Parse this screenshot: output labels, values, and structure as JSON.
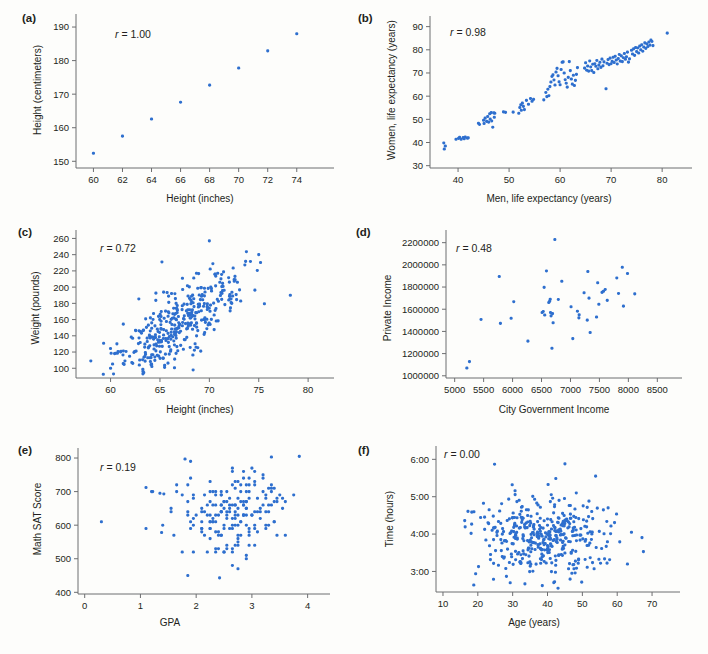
{
  "figure": {
    "type": "scatterplot-matrix-figure",
    "background": "#fdfdfb",
    "dot_color": "#2e6fce",
    "axis_color": "#6d6e70",
    "text_color": "#231f20"
  },
  "panels": [
    {
      "tag": "(a)",
      "r_label": "r = 1.00",
      "r_value": 1.0,
      "xlabel": "Height (inches)",
      "ylabel": "Height (centimeters)",
      "xticks": [
        60,
        62,
        64,
        66,
        68,
        70,
        72,
        74
      ],
      "yticks": [
        150,
        160,
        170,
        180,
        190
      ],
      "xlim": [
        58.8,
        75.6
      ],
      "ylim": [
        148,
        191.5
      ]
    },
    {
      "tag": "(b)",
      "r_label": "r = 0.98",
      "r_value": 0.98,
      "xlabel": "Men, life expectancy (years)",
      "ylabel": "Women, life expectancy (years)",
      "xticks": [
        40,
        50,
        60,
        70,
        80
      ],
      "yticks": [
        30,
        40,
        50,
        60,
        70,
        80,
        90
      ],
      "xlim": [
        34.5,
        83.5
      ],
      "ylim": [
        29,
        92
      ]
    },
    {
      "tag": "(c)",
      "r_label": "r = 0.72",
      "r_value": 0.72,
      "xlabel": "Height (inches)",
      "ylabel": "Weight (pounds)",
      "xticks": [
        60,
        65,
        70,
        75,
        80
      ],
      "yticks": [
        100,
        120,
        140,
        160,
        180,
        200,
        220,
        240,
        260
      ],
      "xlim": [
        56.5,
        81
      ],
      "ylim": [
        88,
        263
      ]
    },
    {
      "tag": "(d)",
      "r_label": "r = 0.48",
      "r_value": 0.48,
      "xlabel": "City Government Income",
      "ylabel": "Private Income",
      "xticks": [
        5000,
        5500,
        6000,
        6500,
        7000,
        7500,
        8000,
        8500
      ],
      "yticks": [
        1000000,
        1200000,
        1400000,
        1600000,
        1800000,
        2000000,
        2200000
      ],
      "xlim": [
        4850,
        8650
      ],
      "ylim": [
        980000,
        2260000
      ]
    },
    {
      "tag": "(e)",
      "r_label": "r = 0.19",
      "r_value": 0.19,
      "xlabel": "GPA",
      "ylabel": "Math SAT Score",
      "xticks": [
        0,
        1,
        2,
        3,
        4
      ],
      "yticks": [
        400,
        500,
        600,
        700,
        800
      ],
      "xlim": [
        -0.12,
        4.15
      ],
      "ylim": [
        395,
        812
      ]
    },
    {
      "tag": "(f)",
      "r_label": "r = 0.00",
      "r_value": 0.0,
      "xlabel": "Age (years)",
      "ylabel": "Time (hours)",
      "xticks": [
        "10",
        "20",
        "30",
        "40",
        "50",
        "60",
        "70"
      ],
      "xtickvals": [
        10,
        20,
        30,
        40,
        50,
        60,
        70
      ],
      "yticks": [
        "3:00",
        "4:00",
        "5:00",
        "6:00"
      ],
      "ytickvals": [
        3,
        4,
        5,
        6
      ],
      "xlim": [
        8,
        74
      ],
      "ylim": [
        2.45,
        6.25
      ]
    }
  ],
  "chart_data": [
    {
      "type": "scatter",
      "panel": "a",
      "title": "Height (centimeters) vs Height (inches)",
      "xlabel": "Height (inches)",
      "ylabel": "Height (centimeters)",
      "correlation": 1.0,
      "xlim": [
        58.8,
        75.6
      ],
      "ylim": [
        148,
        191.5
      ],
      "grid": false,
      "legend": "none",
      "points": [
        [
          60,
          152.4
        ],
        [
          62,
          157.5
        ],
        [
          64,
          162.6
        ],
        [
          66,
          167.6
        ],
        [
          68,
          172.7
        ],
        [
          70,
          177.8
        ],
        [
          72,
          182.9
        ],
        [
          74,
          188.0
        ]
      ]
    },
    {
      "type": "scatter",
      "panel": "b",
      "title": "Women vs Men life expectancy",
      "xlabel": "Men, life expectancy (years)",
      "ylabel": "Women, life expectancy (years)",
      "correlation": 0.98,
      "xlim": [
        34.5,
        83.5
      ],
      "ylim": [
        29,
        92
      ],
      "grid": false,
      "legend": "none",
      "points": [
        [
          37.2,
          39.8
        ],
        [
          37.3,
          37.2
        ],
        [
          37.5,
          38.5
        ],
        [
          39.6,
          41.4
        ],
        [
          40.1,
          41.8
        ],
        [
          40.3,
          42.2
        ],
        [
          40.6,
          41.4
        ],
        [
          41.0,
          42.1
        ],
        [
          41.2,
          41.6
        ],
        [
          41.4,
          42.4
        ],
        [
          41.8,
          41.9
        ],
        [
          42.0,
          42.0
        ],
        [
          44.0,
          48.3
        ],
        [
          44.2,
          47.8
        ],
        [
          45.0,
          49.6
        ],
        [
          45.1,
          48.2
        ],
        [
          45.3,
          50.5
        ],
        [
          45.6,
          49.1
        ],
        [
          45.8,
          51.2
        ],
        [
          46.0,
          48.8
        ],
        [
          46.2,
          52.4
        ],
        [
          46.3,
          50.1
        ],
        [
          46.5,
          52.9
        ],
        [
          46.6,
          49.3
        ],
        [
          46.8,
          46.6
        ],
        [
          47.0,
          52.8
        ],
        [
          47.1,
          50.9
        ],
        [
          47.2,
          52.6
        ],
        [
          48.9,
          53.2
        ],
        [
          49.3,
          53.0
        ],
        [
          50.8,
          53.1
        ],
        [
          51.9,
          52.6
        ],
        [
          52.1,
          55.1
        ],
        [
          52.3,
          56.3
        ],
        [
          52.4,
          53.9
        ],
        [
          52.6,
          57.0
        ],
        [
          52.8,
          55.6
        ],
        [
          53.0,
          54.2
        ],
        [
          53.4,
          58.2
        ],
        [
          53.8,
          56.5
        ],
        [
          54.2,
          59.0
        ],
        [
          54.5,
          57.8
        ],
        [
          54.8,
          58.6
        ],
        [
          56.8,
          58.4
        ],
        [
          57.2,
          61.6
        ],
        [
          57.4,
          59.8
        ],
        [
          57.6,
          63.0
        ],
        [
          57.8,
          60.2
        ],
        [
          58.0,
          64.1
        ],
        [
          58.2,
          66.1
        ],
        [
          58.4,
          68.5
        ],
        [
          58.6,
          69.2
        ],
        [
          58.8,
          67.0
        ],
        [
          59.0,
          64.8
        ],
        [
          59.2,
          70.4
        ],
        [
          59.4,
          72.0
        ],
        [
          59.6,
          68.8
        ],
        [
          59.8,
          66.2
        ],
        [
          60.0,
          64.9
        ],
        [
          60.2,
          71.5
        ],
        [
          60.4,
          74.6
        ],
        [
          60.6,
          74.8
        ],
        [
          60.8,
          70.0
        ],
        [
          61.0,
          67.1
        ],
        [
          61.2,
          65.6
        ],
        [
          61.4,
          63.9
        ],
        [
          61.6,
          68.1
        ],
        [
          61.8,
          74.9
        ],
        [
          62.0,
          71.0
        ],
        [
          62.2,
          67.4
        ],
        [
          62.4,
          65.2
        ],
        [
          62.6,
          69.0
        ],
        [
          62.8,
          64.6
        ],
        [
          63.0,
          66.8
        ],
        [
          63.2,
          69.4
        ],
        [
          63.4,
          72.3
        ],
        [
          64.8,
          72.1
        ],
        [
          65.0,
          74.4
        ],
        [
          65.2,
          71.2
        ],
        [
          65.4,
          73.0
        ],
        [
          65.6,
          70.8
        ],
        [
          65.8,
          75.2
        ],
        [
          66.0,
          72.6
        ],
        [
          66.2,
          71.0
        ],
        [
          66.4,
          73.8
        ],
        [
          66.6,
          70.2
        ],
        [
          66.8,
          74.0
        ],
        [
          67.0,
          72.9
        ],
        [
          67.2,
          75.4
        ],
        [
          67.4,
          71.8
        ],
        [
          67.6,
          73.4
        ],
        [
          67.8,
          74.6
        ],
        [
          68.0,
          72.4
        ],
        [
          68.2,
          76.0
        ],
        [
          68.4,
          73.1
        ],
        [
          68.6,
          74.8
        ],
        [
          69.0,
          63.2
        ],
        [
          69.2,
          74.2
        ],
        [
          69.4,
          75.8
        ],
        [
          69.6,
          73.6
        ],
        [
          69.8,
          76.4
        ],
        [
          70.0,
          74.0
        ],
        [
          70.2,
          75.0
        ],
        [
          70.4,
          76.8
        ],
        [
          70.6,
          74.5
        ],
        [
          70.8,
          77.2
        ],
        [
          71.0,
          75.6
        ],
        [
          71.2,
          73.9
        ],
        [
          71.4,
          76.2
        ],
        [
          71.6,
          78.0
        ],
        [
          71.8,
          75.1
        ],
        [
          72.0,
          77.4
        ],
        [
          72.2,
          74.9
        ],
        [
          72.4,
          76.6
        ],
        [
          72.6,
          78.4
        ],
        [
          72.8,
          75.9
        ],
        [
          73.0,
          77.0
        ],
        [
          73.2,
          79.0
        ],
        [
          73.4,
          74.7
        ],
        [
          73.6,
          76.1
        ],
        [
          74.0,
          79.8
        ],
        [
          74.2,
          78.2
        ],
        [
          74.4,
          80.4
        ],
        [
          74.6,
          77.6
        ],
        [
          74.8,
          81.0
        ],
        [
          75.0,
          79.2
        ],
        [
          75.2,
          80.8
        ],
        [
          75.4,
          78.6
        ],
        [
          75.6,
          81.6
        ],
        [
          75.8,
          80.0
        ],
        [
          76.0,
          82.2
        ],
        [
          76.2,
          79.4
        ],
        [
          76.4,
          81.2
        ],
        [
          76.6,
          83.0
        ],
        [
          76.8,
          80.6
        ],
        [
          77.0,
          82.6
        ],
        [
          77.2,
          81.4
        ],
        [
          77.4,
          83.4
        ],
        [
          77.6,
          82.0
        ],
        [
          77.8,
          84.2
        ],
        [
          78.0,
          83.6
        ],
        [
          78.2,
          81.8
        ],
        [
          81.0,
          87.2
        ]
      ]
    },
    {
      "type": "scatter",
      "panel": "c",
      "title": "Weight vs Height",
      "xlabel": "Height (inches)",
      "ylabel": "Weight (pounds)",
      "correlation": 0.72,
      "xlim": [
        56.5,
        81
      ],
      "ylim": [
        88,
        263
      ],
      "grid": false,
      "legend": "none",
      "n_points": 380
    },
    {
      "type": "scatter",
      "panel": "d",
      "title": "Private Income vs City Government Income",
      "xlabel": "City Government Income",
      "ylabel": "Private Income",
      "correlation": 0.48,
      "xlim": [
        4850,
        8650
      ],
      "ylim": [
        980000,
        2260000
      ],
      "grid": false,
      "legend": "none",
      "points": [
        [
          5210,
          1070000
        ],
        [
          5255,
          1128000
        ],
        [
          5455,
          1508000
        ],
        [
          5770,
          1895000
        ],
        [
          5790,
          1472000
        ],
        [
          5975,
          1518000
        ],
        [
          6020,
          1668000
        ],
        [
          6265,
          1312000
        ],
        [
          6510,
          1570000
        ],
        [
          6530,
          1580000
        ],
        [
          6545,
          1797000
        ],
        [
          6555,
          1548000
        ],
        [
          6585,
          1945000
        ],
        [
          6625,
          1660000
        ],
        [
          6640,
          1672000
        ],
        [
          6650,
          1690000
        ],
        [
          6655,
          1570000
        ],
        [
          6665,
          1540000
        ],
        [
          6680,
          1248000
        ],
        [
          6690,
          1560000
        ],
        [
          6700,
          1478000
        ],
        [
          6730,
          2228000
        ],
        [
          6790,
          1688000
        ],
        [
          6850,
          1852000
        ],
        [
          7010,
          1622000
        ],
        [
          7040,
          1335000
        ],
        [
          7120,
          1582000
        ],
        [
          7145,
          1522000
        ],
        [
          7150,
          1550000
        ],
        [
          7235,
          1748000
        ],
        [
          7290,
          1502000
        ],
        [
          7300,
          1940000
        ],
        [
          7320,
          1700000
        ],
        [
          7340,
          1390000
        ],
        [
          7450,
          1530000
        ],
        [
          7470,
          1838000
        ],
        [
          7490,
          1645000
        ],
        [
          7545,
          1752000
        ],
        [
          7570,
          1762000
        ],
        [
          7600,
          1778000
        ],
        [
          7635,
          1680000
        ],
        [
          7800,
          1882000
        ],
        [
          7830,
          1742000
        ],
        [
          7895,
          1978000
        ],
        [
          7915,
          1628000
        ],
        [
          7985,
          1922000
        ],
        [
          8110,
          1738000
        ]
      ]
    },
    {
      "type": "scatter",
      "panel": "e",
      "title": "Math SAT Score vs GPA",
      "xlabel": "GPA",
      "ylabel": "Math SAT Score",
      "correlation": 0.19,
      "xlim": [
        -0.12,
        4.15
      ],
      "ylim": [
        395,
        812
      ],
      "grid": false,
      "legend": "none",
      "n_points": 205
    },
    {
      "type": "scatter",
      "panel": "f",
      "title": "Time (hours) vs Age (years)",
      "xlabel": "Age (years)",
      "ylabel": "Time (hours)",
      "correlation": 0.0,
      "xlim": [
        8,
        74
      ],
      "ylim": [
        2.45,
        6.25
      ],
      "grid": false,
      "legend": "none",
      "n_points": 420
    }
  ]
}
